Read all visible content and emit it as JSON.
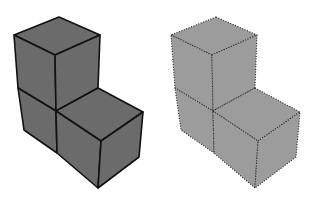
{
  "figure": {
    "shapes": [
      {
        "name": "solid-cubes",
        "edge_style": "solid",
        "fill_color": "#6b6b6b",
        "edge_color": "#111111",
        "cube_count": 3
      },
      {
        "name": "dotted-cubes",
        "edge_style": "dotted",
        "fill_color": "#9c9c9c",
        "edge_color": "#222222",
        "cube_count": 3
      }
    ]
  }
}
